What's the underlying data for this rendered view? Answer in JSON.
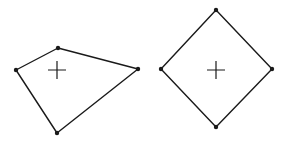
{
  "figure": {
    "stroke_color": "#1a1a1a",
    "background": "#ffffff",
    "shapes": [
      {
        "name": "irregular-quadrilateral",
        "vertices": [
          [
            58,
            48
          ],
          [
            138,
            69
          ],
          [
            57,
            133
          ],
          [
            16,
            70
          ]
        ],
        "center_marker": [
          57,
          70
        ]
      },
      {
        "name": "diamond",
        "vertices": [
          [
            216,
            10
          ],
          [
            272,
            69
          ],
          [
            216,
            127
          ],
          [
            161,
            69
          ]
        ],
        "center_marker": [
          216,
          70
        ]
      }
    ]
  }
}
